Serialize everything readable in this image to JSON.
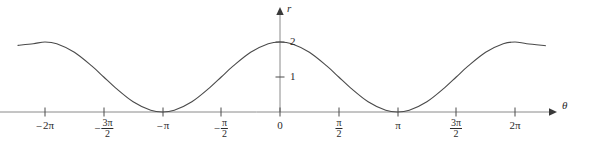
{
  "figure": {
    "width": 590,
    "height": 144,
    "background_color": "#ffffff",
    "line_color": "#4a4a4a",
    "axis_color": "#7a7a7a",
    "text_color": "#2b2b2b"
  },
  "axes": {
    "x_axis_label": "θ",
    "y_axis_label": "r",
    "origin_label": "0",
    "x_ticks": [
      {
        "value": -2,
        "label_parts": {
          "sign": "−",
          "main": "2π",
          "numerator": "",
          "denominator": ""
        }
      },
      {
        "value": -1.5,
        "label_parts": {
          "sign": "−",
          "main": "",
          "numerator": "3π",
          "denominator": "2"
        }
      },
      {
        "value": -1,
        "label_parts": {
          "sign": "−",
          "main": "π",
          "numerator": "",
          "denominator": ""
        }
      },
      {
        "value": -0.5,
        "label_parts": {
          "sign": "−",
          "main": "",
          "numerator": "π",
          "denominator": "2"
        }
      },
      {
        "value": 0,
        "label_parts": {
          "sign": "",
          "main": "0",
          "numerator": "",
          "denominator": ""
        }
      },
      {
        "value": 0.5,
        "label_parts": {
          "sign": "",
          "main": "",
          "numerator": "π",
          "denominator": "2"
        }
      },
      {
        "value": 1,
        "label_parts": {
          "sign": "",
          "main": "π",
          "numerator": "",
          "denominator": ""
        }
      },
      {
        "value": 1.5,
        "label_parts": {
          "sign": "",
          "main": "",
          "numerator": "3π",
          "denominator": "2"
        }
      },
      {
        "value": 2,
        "label_parts": {
          "sign": "",
          "main": "2π",
          "numerator": "",
          "denominator": ""
        }
      }
    ],
    "y_ticks": [
      {
        "value": 1,
        "label": "1"
      },
      {
        "value": 2,
        "label": "2"
      }
    ]
  },
  "chart_data": {
    "type": "line",
    "title": "",
    "xlabel": "θ",
    "ylabel": "r",
    "grid": false,
    "legend": "none",
    "equation": "r = 1 + cos(θ)",
    "xlim_pi_units": [
      -2.23,
      2.26
    ],
    "ylim": [
      0,
      2.2
    ],
    "x_tick_values_pi_units": [
      -2,
      -1.5,
      -1,
      -0.5,
      0,
      0.5,
      1,
      1.5,
      2
    ],
    "x_tick_labels": [
      "-2π",
      "-3π/2",
      "-π",
      "-π/2",
      "0",
      "π/2",
      "π",
      "3π/2",
      "2π"
    ],
    "y_tick_values": [
      1,
      2
    ],
    "y_tick_labels": [
      "1",
      "2"
    ],
    "series": [
      {
        "name": "r = 1 + cos(θ)",
        "x_pi_units": [
          -2.23,
          -2.1,
          -2.0,
          -1.9,
          -1.75,
          -1.6,
          -1.5,
          -1.4,
          -1.25,
          -1.1,
          -1.0,
          -0.9,
          -0.75,
          -0.6,
          -0.5,
          -0.4,
          -0.25,
          -0.1,
          0,
          0.1,
          0.25,
          0.4,
          0.5,
          0.6,
          0.75,
          0.9,
          1.0,
          1.1,
          1.25,
          1.4,
          1.5,
          1.6,
          1.75,
          1.9,
          2.0,
          2.1,
          2.26
        ],
        "y": [
          1.905,
          1.951,
          2.0,
          1.951,
          1.707,
          1.309,
          1.0,
          0.691,
          0.293,
          0.049,
          0.0,
          0.049,
          0.293,
          0.691,
          1.0,
          1.309,
          1.707,
          1.951,
          2.0,
          1.951,
          1.707,
          1.309,
          1.0,
          0.691,
          0.293,
          0.049,
          0.0,
          0.049,
          0.293,
          0.691,
          1.0,
          1.309,
          1.707,
          1.951,
          2.0,
          1.951,
          1.893
        ],
        "maxima_at_pi_units": [
          -2,
          0,
          2
        ],
        "maxima_value": 2,
        "minima_at_pi_units": [
          -1,
          1
        ],
        "minima_value": 0
      }
    ]
  },
  "geometry": {
    "origin_x_px": 280,
    "baseline_y_px": 112,
    "px_per_pi": 117.5,
    "px_per_r_unit": 35,
    "curve_start_x_px": 18,
    "curve_end_x_px": 545,
    "x_arrow_tip_px": 553,
    "y_arrow_tip_px": 8
  }
}
